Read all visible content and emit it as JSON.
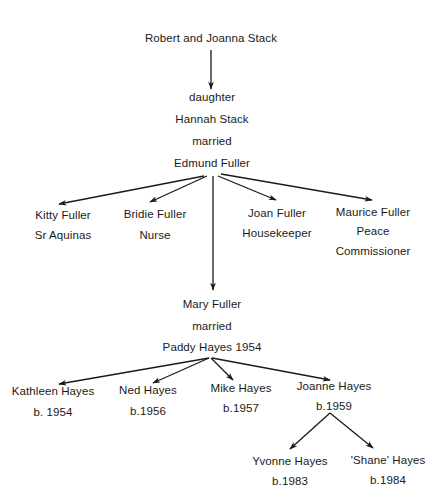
{
  "diagram": {
    "type": "family-tree",
    "nodes": {
      "root": {
        "lines": [
          "Robert and Joanna Stack"
        ]
      },
      "hannah": {
        "lines": [
          "daughter",
          "Hannah Stack",
          "married",
          "Edmund Fuller"
        ]
      },
      "kitty": {
        "lines": [
          "Kitty Fuller",
          "Sr Aquinas"
        ]
      },
      "bridie": {
        "lines": [
          "Bridie Fuller",
          "Nurse"
        ]
      },
      "joan": {
        "lines": [
          "Joan Fuller",
          "Housekeeper"
        ]
      },
      "maurice": {
        "lines": [
          "Maurice Fuller",
          "Peace",
          "Commissioner"
        ]
      },
      "mary": {
        "lines": [
          "Mary Fuller",
          "married",
          "Paddy Hayes 1954"
        ]
      },
      "kathleen": {
        "lines": [
          "Kathleen Hayes",
          "b. 1954"
        ]
      },
      "ned": {
        "lines": [
          "Ned Hayes",
          "b.1956"
        ]
      },
      "mike": {
        "lines": [
          "Mike Hayes",
          "b.1957"
        ]
      },
      "joanne": {
        "lines": [
          "Joanne Hayes",
          "b.1959"
        ]
      },
      "yvonne": {
        "lines": [
          "Yvonne Hayes",
          "b.1983"
        ]
      },
      "shane": {
        "lines": [
          "'Shane' Hayes",
          "b.1984"
        ]
      }
    },
    "edges": [
      [
        "root",
        "hannah"
      ],
      [
        "hannah",
        "kitty"
      ],
      [
        "hannah",
        "bridie"
      ],
      [
        "hannah",
        "mary"
      ],
      [
        "hannah",
        "joan"
      ],
      [
        "hannah",
        "maurice"
      ],
      [
        "mary",
        "kathleen"
      ],
      [
        "mary",
        "ned"
      ],
      [
        "mary",
        "mike"
      ],
      [
        "mary",
        "joanne"
      ],
      [
        "joanne",
        "yvonne"
      ],
      [
        "joanne",
        "shane"
      ]
    ],
    "colors": {
      "line": "#1a1a1a",
      "text": "#1a1a1a",
      "background": "#ffffff"
    }
  }
}
